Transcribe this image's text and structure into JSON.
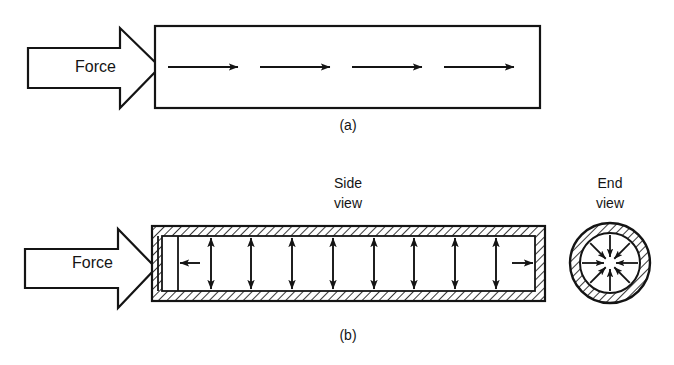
{
  "figure": {
    "background_color": "#ffffff",
    "ink_color": "#141414",
    "width": 674,
    "height": 365
  },
  "panel_a": {
    "id": "panel-a",
    "caption": "(a)",
    "caption_x": 348,
    "caption_y": 130,
    "force_label": "Force",
    "force_label_x": 75,
    "force_label_y": 72,
    "force_arrow": {
      "name": "force-block-arrow",
      "tail_left": 28,
      "tail_right": 120,
      "tail_top": 48,
      "tail_bottom": 88,
      "head_back": 120,
      "head_top": 28,
      "head_bottom": 108,
      "tip_x": 160,
      "tip_y": 67
    },
    "body": {
      "name": "solid-bar-outline",
      "x": 155,
      "y": 26,
      "width": 385,
      "height": 82,
      "stroke_width": 2.2
    },
    "internal_arrows": {
      "direction": "right",
      "y": 67,
      "count": 4,
      "items": [
        {
          "x1": 168,
          "x2": 238
        },
        {
          "x1": 260,
          "x2": 330
        },
        {
          "x1": 352,
          "x2": 422
        },
        {
          "x1": 444,
          "x2": 514
        }
      ]
    }
  },
  "panel_b": {
    "id": "panel-b",
    "caption": "(b)",
    "caption_x": 348,
    "caption_y": 340,
    "force_label": "Force",
    "force_label_x": 72,
    "force_label_y": 268,
    "side_view_label_line1": "Side",
    "side_view_label_line2": "view",
    "side_view_label_x": 348,
    "side_view_label_y1": 188,
    "side_view_label_y2": 208,
    "end_view_label_line1": "End",
    "end_view_label_line2": "view",
    "end_view_label_x": 610,
    "end_view_label_y1": 188,
    "end_view_label_y2": 208,
    "force_arrow": {
      "name": "force-block-arrow",
      "tail_left": 25,
      "tail_right": 118,
      "tail_top": 249,
      "tail_bottom": 288,
      "head_back": 118,
      "head_top": 229,
      "head_bottom": 308,
      "tip_x": 156,
      "tip_y": 268
    },
    "cylinder": {
      "name": "side-view-cylinder",
      "outer_left": 152,
      "outer_right": 545,
      "outer_top": 226,
      "outer_bottom": 301,
      "wall_thickness": 10,
      "bore_left": 162,
      "bore_right": 535,
      "bore_top": 236,
      "bore_bottom": 291,
      "hatch_spacing": 6,
      "hatch_angle_deg": 45
    },
    "piston": {
      "name": "piston-plate",
      "face_x": 158,
      "back_x": 178,
      "top": 236,
      "bottom": 291
    },
    "horizontal_arrows": [
      {
        "name": "left-pressure-arrow",
        "direction": "left",
        "x1": 200,
        "x2": 180,
        "y": 263
      },
      {
        "name": "right-pressure-arrow",
        "direction": "right",
        "x1": 512,
        "x2": 533,
        "y": 263
      }
    ],
    "vertical_arrow_pairs": {
      "count": 8,
      "center_y": 263,
      "up_tip_y": 238,
      "down_tip_y": 289,
      "x_positions": [
        211,
        251,
        292,
        333,
        374,
        414,
        455,
        496
      ]
    },
    "end_view": {
      "name": "end-view-annulus",
      "center_x": 610,
      "center_y": 263,
      "outer_radius": 40,
      "inner_radius": 30,
      "hatch_spacing": 6,
      "arrow_count": 8,
      "arrow_angles_deg": [
        0,
        45,
        90,
        135,
        180,
        225,
        270,
        315
      ],
      "arrow_outer_radius": 28,
      "arrow_inner_radius": 6
    }
  }
}
